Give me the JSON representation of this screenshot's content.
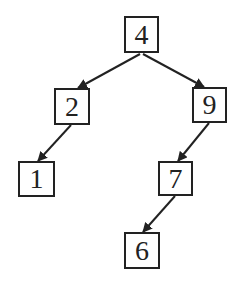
{
  "diagram": {
    "type": "binary-search-tree",
    "colors": {
      "stroke": "#222222",
      "background": "#ffffff"
    },
    "nodes": [
      {
        "id": "n4",
        "label": "4",
        "x": 124,
        "y": 16,
        "w": 35,
        "h": 37
      },
      {
        "id": "n2",
        "label": "2",
        "x": 54,
        "y": 88,
        "w": 36,
        "h": 37
      },
      {
        "id": "n9",
        "label": "9",
        "x": 192,
        "y": 87,
        "w": 35,
        "h": 36
      },
      {
        "id": "n1",
        "label": "1",
        "x": 18,
        "y": 161,
        "w": 37,
        "h": 36
      },
      {
        "id": "n7",
        "label": "7",
        "x": 158,
        "y": 161,
        "w": 35,
        "h": 35
      },
      {
        "id": "n6",
        "label": "6",
        "x": 124,
        "y": 232,
        "w": 36,
        "h": 37
      }
    ],
    "edges": [
      {
        "from": "4",
        "to": "2",
        "x1": 140,
        "y1": 54,
        "x2": 78,
        "y2": 88
      },
      {
        "from": "4",
        "to": "9",
        "x1": 143,
        "y1": 54,
        "x2": 204,
        "y2": 87
      },
      {
        "from": "2",
        "to": "1",
        "x1": 71,
        "y1": 125,
        "x2": 38,
        "y2": 161
      },
      {
        "from": "9",
        "to": "7",
        "x1": 209,
        "y1": 123,
        "x2": 178,
        "y2": 161
      },
      {
        "from": "7",
        "to": "6",
        "x1": 175,
        "y1": 196,
        "x2": 143,
        "y2": 232
      }
    ]
  }
}
